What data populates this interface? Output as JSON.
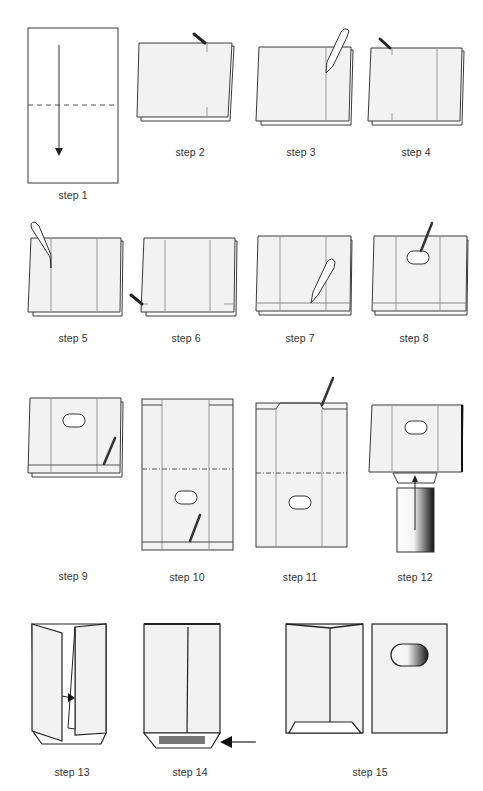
{
  "colors": {
    "stroke": "#3a3a3a",
    "paper": "#f2f2f2",
    "crease": "#9a9a9a",
    "glue": "#777777",
    "tool_dark": "#222222"
  },
  "steps": [
    {
      "number": 1,
      "label": "step 1",
      "depicts": "fold sheet in half along dashed line, arrow downward"
    },
    {
      "number": 2,
      "label": "step 2",
      "depicts": "mark center crease with pen at top edge"
    },
    {
      "number": 3,
      "label": "step 3",
      "depicts": "crease vertical fold with bone folder"
    },
    {
      "number": 4,
      "label": "step 4",
      "depicts": "mark second vertical line with pen"
    },
    {
      "number": 5,
      "label": "step 5",
      "depicts": "crease second vertical fold with bone folder"
    },
    {
      "number": 6,
      "label": "step 6",
      "depicts": "mark bottom flap height with pen"
    },
    {
      "number": 7,
      "label": "step 7",
      "depicts": "crease bottom flap with bone folder"
    },
    {
      "number": 8,
      "label": "step 8",
      "depicts": "draw window opening with pen"
    },
    {
      "number": 9,
      "label": "step 9",
      "depicts": "mark bottom flap line with pen"
    },
    {
      "number": 10,
      "label": "step 10",
      "depicts": "unfolded sheet with window and crease lines"
    },
    {
      "number": 11,
      "label": "step 11",
      "depicts": "cut top flap corners"
    },
    {
      "number": 12,
      "label": "step 12",
      "depicts": "insert tube from below, arrow upward"
    },
    {
      "number": 13,
      "label": "step 13",
      "depicts": "fold side panels inward, arrow to center"
    },
    {
      "number": 14,
      "label": "step 14",
      "depicts": "apply glue strip to bottom flap, arrow pointing left"
    },
    {
      "number": 15,
      "label": "step 15",
      "depicts": "finished envelope, back and front with window"
    }
  ]
}
